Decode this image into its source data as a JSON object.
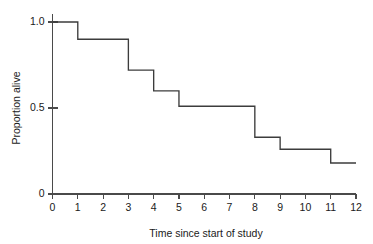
{
  "chart_data": {
    "type": "line",
    "subtype": "step",
    "title": "",
    "xlabel": "Time since start of study",
    "ylabel": "Proportion alive",
    "xlim": [
      0,
      12
    ],
    "ylim": [
      0,
      1.0
    ],
    "grid": false,
    "legend": null,
    "line_color": "#3c3c3c",
    "axis_color": "#4a4a4a",
    "x_ticks": [
      0,
      1,
      2,
      3,
      4,
      5,
      6,
      7,
      8,
      9,
      10,
      11,
      12
    ],
    "x_tick_labels": [
      "0",
      "1",
      "2",
      "3",
      "4",
      "5",
      "6",
      "7",
      "8",
      "9",
      "10",
      "11",
      "12"
    ],
    "y_ticks": [
      0,
      0.5,
      1.0
    ],
    "y_tick_labels": [
      "0",
      "0.5",
      "1.0"
    ],
    "x": [
      0,
      1,
      3,
      4,
      5,
      8,
      9,
      11,
      12
    ],
    "values": [
      1.0,
      0.9,
      0.72,
      0.6,
      0.51,
      0.33,
      0.26,
      0.18,
      0.18
    ],
    "steps": [
      {
        "t_start": 0,
        "t_end": 1,
        "proportion_alive": 1.0
      },
      {
        "t_start": 1,
        "t_end": 3,
        "proportion_alive": 0.9
      },
      {
        "t_start": 3,
        "t_end": 4,
        "proportion_alive": 0.72
      },
      {
        "t_start": 4,
        "t_end": 5,
        "proportion_alive": 0.6
      },
      {
        "t_start": 5,
        "t_end": 8,
        "proportion_alive": 0.51
      },
      {
        "t_start": 8,
        "t_end": 9,
        "proportion_alive": 0.33
      },
      {
        "t_start": 9,
        "t_end": 11,
        "proportion_alive": 0.26
      },
      {
        "t_start": 11,
        "t_end": 12,
        "proportion_alive": 0.18
      }
    ]
  }
}
